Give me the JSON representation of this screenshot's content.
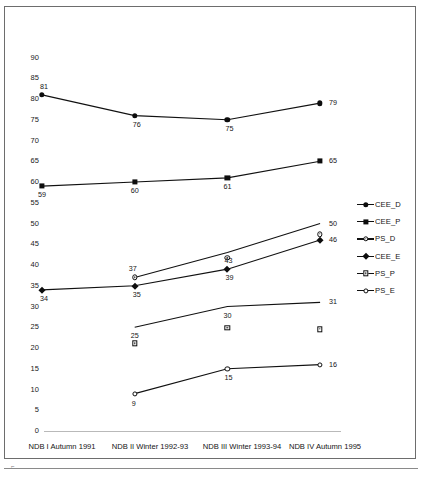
{
  "chart_data": {
    "type": "line",
    "title": "",
    "xlabel": "",
    "ylabel": "",
    "ylim": [
      0,
      90
    ],
    "ytick_step": 5,
    "grid": false,
    "legend_position": "right",
    "categories": [
      "NDB I Autumn 1991",
      "NDB II Winter 1992-93",
      "NDB III Winter 1993-94",
      "NDB IV Autumn 1995"
    ],
    "ytick_labels": [
      "90",
      "85",
      "80",
      "75",
      "70",
      "65",
      "60",
      "55",
      "50",
      "45",
      "40",
      "35",
      "30",
      "25",
      "20",
      "15",
      "10",
      "5",
      "0"
    ],
    "series": [
      {
        "name": "CEE_D",
        "marker": "circle-filled",
        "values": [
          81,
          76,
          75,
          79
        ],
        "labels": [
          "81",
          "76",
          "75",
          "79"
        ]
      },
      {
        "name": "CEE_P",
        "marker": "square-filled",
        "values": [
          59,
          60,
          61,
          65
        ],
        "labels": [
          "59",
          "60",
          "61",
          "65"
        ]
      },
      {
        "name": "PS_D",
        "marker": "circle-dot",
        "values": [
          null,
          37,
          43,
          50
        ],
        "labels": [
          "",
          "37",
          "43",
          "50"
        ]
      },
      {
        "name": "CEE_E",
        "marker": "diamond-filled",
        "values": [
          34,
          35,
          39,
          46
        ],
        "labels": [
          "34",
          "35",
          "39",
          "46"
        ]
      },
      {
        "name": "PS_P",
        "marker": "square-open",
        "values": [
          null,
          25,
          30,
          31
        ],
        "labels": [
          "",
          "25",
          "30",
          "31"
        ]
      },
      {
        "name": "PS_E",
        "marker": "circle-open",
        "values": [
          null,
          9,
          15,
          16
        ],
        "labels": [
          "",
          "9",
          "15",
          "16"
        ]
      }
    ]
  },
  "legend": {
    "items": [
      {
        "label": "CEE_D",
        "marker": "circle-filled"
      },
      {
        "label": "CEE_P",
        "marker": "square-filled"
      },
      {
        "label": "PS_D",
        "marker": "circle-dot"
      },
      {
        "label": "CEE_E",
        "marker": "diamond-filled"
      },
      {
        "label": "PS_P",
        "marker": "square-open"
      },
      {
        "label": "PS_E",
        "marker": "circle-open"
      }
    ]
  },
  "colors": {
    "line": "#111111",
    "marker": "#0d0d0d",
    "text": "#141414",
    "frame": "#6d6d6d",
    "baseline": "#b9b9b9"
  },
  "page": {
    "corner_tick": "⌐"
  }
}
